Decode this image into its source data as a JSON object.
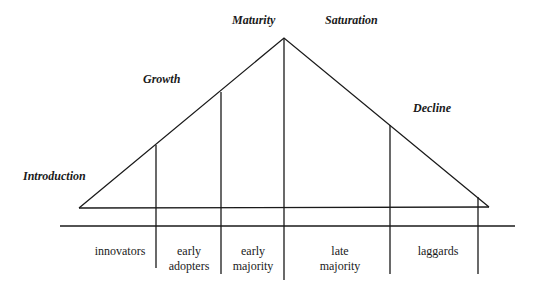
{
  "diagram": {
    "type": "product-life-cycle-adopter-categories",
    "phases": [
      {
        "label": "Introduction"
      },
      {
        "label": "Growth"
      },
      {
        "label": "Maturity"
      },
      {
        "label": "Saturation"
      },
      {
        "label": "Decline"
      }
    ],
    "segments": [
      {
        "line1": "innovators",
        "line2": ""
      },
      {
        "line1": "early",
        "line2": "adopters"
      },
      {
        "line1": "early",
        "line2": "majority"
      },
      {
        "line1": "late",
        "line2": "majority"
      },
      {
        "line1": "laggards",
        "line2": ""
      }
    ],
    "colors": {
      "line": "#1a1a1a",
      "background": "#ffffff"
    }
  }
}
